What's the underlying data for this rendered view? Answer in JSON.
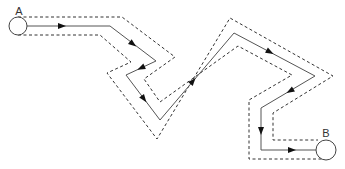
{
  "diagram": {
    "type": "path-with-tolerance-band",
    "start": {
      "label": "A",
      "center": [
        18,
        26
      ],
      "radius": 9,
      "label_pos": [
        19,
        15
      ]
    },
    "end": {
      "label": "B",
      "center": [
        326,
        150
      ],
      "radius": 10,
      "label_pos": [
        326,
        137
      ]
    },
    "colors": {
      "line": "#555555",
      "dashed": "#333333",
      "arrow": "#111111"
    },
    "path": [
      [
        27,
        26
      ],
      [
        110,
        26
      ],
      [
        156,
        61
      ],
      [
        126,
        75
      ],
      [
        160,
        120
      ],
      [
        234,
        33
      ],
      [
        315,
        76
      ],
      [
        261,
        108
      ],
      [
        261,
        150
      ],
      [
        316,
        150
      ]
    ],
    "boundary_1": [
      [
        18,
        17
      ],
      [
        122,
        17
      ],
      [
        175,
        57
      ],
      [
        144,
        79
      ],
      [
        160,
        102
      ],
      [
        238,
        46
      ],
      [
        292,
        75
      ],
      [
        249,
        100
      ],
      [
        249,
        159
      ],
      [
        328,
        159
      ]
    ],
    "boundary_2": [
      [
        18,
        35
      ],
      [
        100,
        35
      ],
      [
        131,
        62
      ],
      [
        107,
        73
      ],
      [
        157,
        139
      ],
      [
        230,
        18
      ],
      [
        333,
        76
      ],
      [
        273,
        113
      ],
      [
        273,
        140
      ],
      [
        318,
        140
      ]
    ],
    "arrows": [
      {
        "at": [
          62,
          26
        ],
        "seg": 0
      },
      {
        "at": [
          133,
          44
        ],
        "seg": 1
      },
      {
        "at": [
          141,
          68
        ],
        "seg": 2
      },
      {
        "at": [
          144,
          99
        ],
        "seg": 3
      },
      {
        "at": [
          193,
          81
        ],
        "seg": 4
      },
      {
        "at": [
          270,
          52
        ],
        "seg": 5
      },
      {
        "at": [
          290,
          91
        ],
        "seg": 6
      },
      {
        "at": [
          261,
          131
        ],
        "seg": 7
      },
      {
        "at": [
          292,
          150
        ],
        "seg": 8
      }
    ]
  }
}
